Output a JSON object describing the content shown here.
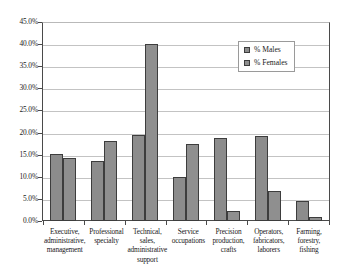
{
  "chart_data": {
    "type": "bar",
    "title": "",
    "xlabel": "",
    "ylabel": "",
    "ylim": [
      0,
      45
    ],
    "grid": true,
    "legend_position": "top-right",
    "y_ticks": [
      "0.0%",
      "5.0%",
      "10.0%",
      "15.0%",
      "20.0%",
      "25.0%",
      "30.0%",
      "35.0%",
      "40.0%",
      "45.0%"
    ],
    "y_tick_values": [
      0,
      5,
      10,
      15,
      20,
      25,
      30,
      35,
      40,
      45
    ],
    "categories": [
      "Executive, administrative, management",
      "Professional specialty",
      "Technical, sales, administrative support",
      "Service occupations",
      "Precision production, crafts",
      "Operators, fabricators, laborers",
      "Farming, forestry, fishing"
    ],
    "category_lines": [
      [
        "Executive,",
        "administrative,",
        "management"
      ],
      [
        "Professional",
        "specialty"
      ],
      [
        "Technical,",
        "sales,",
        "administrative",
        "support"
      ],
      [
        "Service",
        "occupations"
      ],
      [
        "Precision",
        "production,",
        "crafts"
      ],
      [
        "Operators,",
        "fabricators,",
        "laborers"
      ],
      [
        "Farming,",
        "forestry,",
        "fishing"
      ]
    ],
    "series": [
      {
        "name": "% Males",
        "color": "#8c8c8c",
        "values": [
          15.2,
          13.6,
          19.5,
          10.0,
          18.7,
          19.2,
          4.5
        ]
      },
      {
        "name": "% Females",
        "color": "#8f8f8f",
        "values": [
          14.3,
          18.2,
          40.0,
          17.5,
          2.2,
          6.8,
          1.0
        ]
      }
    ]
  },
  "legend": {
    "entries": [
      {
        "label": "% Males",
        "swatch": "legend-swatch-males"
      },
      {
        "label": "% Females",
        "swatch": "legend-swatch-females"
      }
    ]
  },
  "colors": {
    "bar_fill": "#8c8c8c",
    "bar_outline": "#3d3d3d",
    "gridline": "#c3c3c3",
    "axis": "#4a4a4a",
    "background": "#ffffff"
  }
}
